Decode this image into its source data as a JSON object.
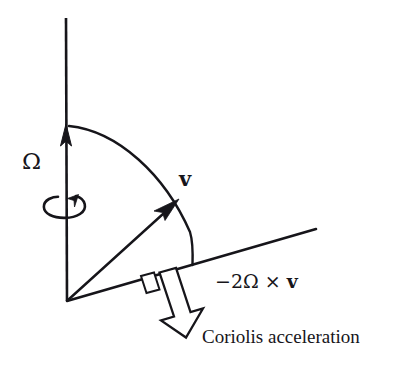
{
  "figure": {
    "background_color": "#ffffff",
    "ink_color": "#16151a"
  },
  "labels": {
    "angular_velocity": "Ω",
    "velocity": "v",
    "coriolis_vector": "−2Ω × ",
    "coriolis_vector_bold_part": "v",
    "coriolis_caption": "Coriolis acceleration"
  },
  "elements": {
    "rotation_axis": "vertical-rotation-axis",
    "rotation_axis_arrowhead": "axis-arrowhead",
    "spin_curl": "rotation-curl-arrow",
    "velocity_arrow": "velocity-vector-arrow",
    "arc": "angle-arc",
    "surface_line": "inclined-surface-line",
    "coriolis_arrow": "hollow-coriolis-arrow",
    "right_angle_mark": "right-angle-marker"
  },
  "geometry": {
    "origin": [
      67,
      301
    ],
    "axis_top": [
      66,
      18
    ],
    "axis_arrow_tip": [
      66,
      124
    ],
    "velocity_tip": [
      178,
      200
    ],
    "surface_right_end": [
      316,
      229
    ],
    "arc_end": [
      192,
      265
    ],
    "coriolis_tip": [
      198,
      337
    ]
  }
}
